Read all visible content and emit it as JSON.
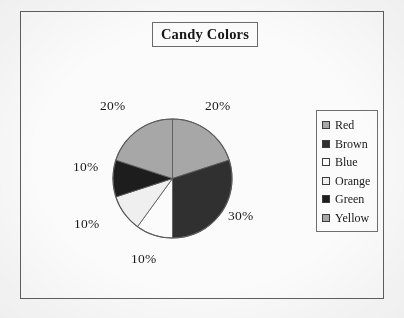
{
  "figure": {
    "title": "Candy Colors"
  },
  "legend": {
    "items": [
      {
        "label": "Red",
        "color": "#a8a8a8"
      },
      {
        "label": "Brown",
        "color": "#2e2e2e"
      },
      {
        "label": "Blue",
        "color": "#ffffff"
      },
      {
        "label": "Orange",
        "color": "#f2f2f2"
      },
      {
        "label": "Green",
        "color": "#1a1a1a"
      },
      {
        "label": "Yellow",
        "color": "#a8a8a8"
      }
    ]
  },
  "labels": {
    "red": "20%",
    "brown": "30%",
    "blue": "10%",
    "orange": "10%",
    "green": "10%",
    "yellow": "20%"
  },
  "chart_data": {
    "type": "pie",
    "title": "Candy Colors",
    "categories": [
      "Red",
      "Brown",
      "Blue",
      "Orange",
      "Green",
      "Yellow"
    ],
    "values": [
      20,
      30,
      10,
      10,
      10,
      20
    ],
    "value_labels": [
      "20%",
      "30%",
      "10%",
      "10%",
      "10%",
      "20%"
    ],
    "unit": "percent",
    "total": 100,
    "colors": [
      "#a8a8a8",
      "#2e2e2e",
      "#ffffff",
      "#f2f2f2",
      "#1a1a1a",
      "#a8a8a8"
    ],
    "start_angle_deg": 0,
    "direction": "clockwise",
    "legend_position": "right",
    "labels_outside": true,
    "grid": false,
    "xlabel": "",
    "ylabel": ""
  }
}
